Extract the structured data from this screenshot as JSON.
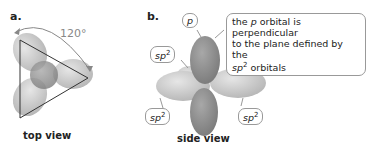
{
  "panel_a": {
    "label": "a.",
    "angle_label": "120°",
    "caption": "top view"
  },
  "panel_b": {
    "label": "b.",
    "caption": "side view",
    "p_label": "p",
    "sp2_label": "sp",
    "sp2_sup": "2",
    "callout": {
      "line1_pre": "the ",
      "line1_italic": "p",
      "line1_post": " orbital is perpendicular",
      "line2": "to the plane defined by the",
      "line3_italic": "sp",
      "line3_sup": "2",
      "line3_post": " orbitals"
    }
  },
  "colors": {
    "sp2_lobe": "#c8c8c8",
    "p_lobe": "#8e8e8e",
    "outline": "#333333"
  }
}
